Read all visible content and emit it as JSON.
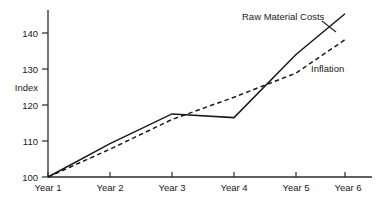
{
  "chart_data": {
    "type": "line",
    "title": "",
    "xlabel": "",
    "ylabel": "Index",
    "categories": [
      "Year 1",
      "Year 2",
      "Year 3",
      "Year 4",
      "Year 5",
      "Year 6"
    ],
    "x": [
      1,
      2,
      3,
      4,
      5,
      6
    ],
    "ylim": [
      100,
      145
    ],
    "yticks": [
      100,
      110,
      120,
      130,
      140
    ],
    "ytick_labels": [
      "100",
      "110",
      "120",
      "130",
      "140"
    ],
    "grid": false,
    "legend_position": "inline-annotations",
    "series": [
      {
        "name": "Raw Material Costs",
        "style": "solid",
        "color": "#1a1a1a",
        "values": [
          100,
          109,
          117,
          116,
          133,
          144
        ]
      },
      {
        "name": "Inflation",
        "style": "dashed",
        "color": "#1a1a1a",
        "values": [
          100,
          107.5,
          115.5,
          121.5,
          128,
          137
        ]
      }
    ],
    "annotations": [
      {
        "text": "Raw Material Costs",
        "series": "Raw Material Costs"
      },
      {
        "text": "Inflation",
        "series": "Inflation"
      }
    ]
  },
  "axis": {
    "y_title": "Index",
    "y_ticks": [
      "140",
      "130",
      "120",
      "110",
      "100"
    ],
    "x_ticks": [
      "Year 1",
      "Year 2",
      "Year 3",
      "Year 4",
      "Year 5",
      "Year 6"
    ]
  },
  "labels": {
    "raw_material_costs": "Raw Material Costs",
    "inflation": "Inflation"
  }
}
